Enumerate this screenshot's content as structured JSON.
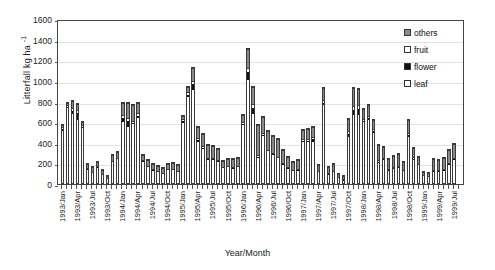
{
  "chart_data": {
    "type": "bar",
    "subtype": "stacked-bar",
    "title": "",
    "xlabel": "Year/Month",
    "ylabel": "Litterfall  kg ha -1",
    "ylabel_plain": "Litterfall kg ha-1",
    "ylim": [
      0,
      1600
    ],
    "yticks": [
      0,
      200,
      400,
      600,
      800,
      1000,
      1200,
      1400,
      1600
    ],
    "grid": true,
    "grid_axis": "y",
    "legend_position": "top-right",
    "legend": [
      "others",
      "fruit",
      "flower",
      "leaf"
    ],
    "colors": {
      "others": "#8a8a8a",
      "fruit": "#ffffff",
      "flower": "#111111",
      "leaf": "#ffffff",
      "outline": "#3a3a3a",
      "grid": "#e3e3e3",
      "axis": "#444444"
    },
    "x_tick_labels": [
      "1993/Jan",
      "1993/Apr",
      "1993/Jul",
      "1993/Oct",
      "1994/Jan",
      "1994/Apr",
      "1994/Jul",
      "1994/Oct",
      "1995/Jan",
      "1995/Apr",
      "1995/Jul",
      "1995/Oct",
      "1996/Jan",
      "1996/Apr",
      "1996/Jul",
      "1996/Oct",
      "1997/Jan",
      "1997/Apr",
      "1997/Jul",
      "1997/Oct",
      "1998/Jan",
      "1998/Apr",
      "1998/Jul",
      "1998/Oct",
      "1999/Jan",
      "1999/Apr",
      "1999/Jul"
    ],
    "x_tick_interval_months": 3,
    "categories": [
      "1993/Jan",
      "1993/Feb",
      "1993/Mar",
      "1993/Apr",
      "1993/May",
      "1993/Jun",
      "1993/Jul",
      "1993/Aug",
      "1993/Sep",
      "1993/Oct",
      "1993/Nov",
      "1993/Dec",
      "1994/Jan",
      "1994/Feb",
      "1994/Mar",
      "1994/Apr",
      "1994/May",
      "1994/Jun",
      "1994/Jul",
      "1994/Aug",
      "1994/Sep",
      "1994/Oct",
      "1994/Nov",
      "1994/Dec",
      "1995/Jan",
      "1995/Feb",
      "1995/Mar",
      "1995/Apr",
      "1995/May",
      "1995/Jun",
      "1995/Jul",
      "1995/Aug",
      "1995/Sep",
      "1995/Oct",
      "1995/Nov",
      "1995/Dec",
      "1996/Jan",
      "1996/Feb",
      "1996/Mar",
      "1996/Apr",
      "1996/May",
      "1996/Jun",
      "1996/Jul",
      "1996/Aug",
      "1996/Sep",
      "1996/Oct",
      "1996/Nov",
      "1996/Dec",
      "1997/Jan",
      "1997/Feb",
      "1997/Mar",
      "1997/Apr",
      "1997/May",
      "1997/Jun",
      "1997/Jul",
      "1997/Aug",
      "1997/Sep",
      "1997/Oct",
      "1997/Nov",
      "1997/Dec",
      "1998/Jan",
      "1998/Feb",
      "1998/Mar",
      "1998/Apr",
      "1998/May",
      "1998/Jun",
      "1998/Jul",
      "1998/Aug",
      "1998/Sep",
      "1998/Oct",
      "1998/Nov",
      "1998/Dec",
      "1999/Jan",
      "1999/Feb",
      "1999/Mar",
      "1999/Apr",
      "1999/May",
      "1999/Jun",
      "1999/Jul",
      "1999/Aug"
    ],
    "series": [
      {
        "name": "leaf",
        "values": [
          540,
          760,
          700,
          640,
          570,
          160,
          120,
          180,
          100,
          60,
          230,
          250,
          620,
          570,
          600,
          660,
          240,
          180,
          150,
          130,
          110,
          145,
          150,
          120,
          620,
          870,
          930,
          430,
          360,
          250,
          250,
          230,
          160,
          170,
          165,
          170,
          600,
          1030,
          700,
          260,
          480,
          330,
          300,
          260,
          200,
          160,
          130,
          140,
          430,
          430,
          430,
          120,
          790,
          105,
          120,
          60,
          40,
          480,
          690,
          690,
          620,
          640,
          520,
          220,
          250,
          140,
          160,
          170,
          130,
          480,
          250,
          190,
          85,
          70,
          130,
          130,
          140,
          200,
          250,
          0
        ]
      },
      {
        "name": "flower",
        "values": [
          20,
          10,
          30,
          70,
          10,
          5,
          5,
          5,
          5,
          5,
          5,
          5,
          40,
          60,
          10,
          25,
          5,
          5,
          5,
          5,
          5,
          5,
          5,
          5,
          15,
          20,
          60,
          15,
          10,
          5,
          5,
          5,
          5,
          5,
          5,
          5,
          10,
          80,
          60,
          10,
          10,
          5,
          5,
          5,
          5,
          5,
          5,
          5,
          10,
          10,
          25,
          5,
          20,
          5,
          5,
          5,
          5,
          30,
          50,
          60,
          15,
          20,
          15,
          10,
          5,
          5,
          5,
          5,
          5,
          15,
          10,
          5,
          5,
          5,
          5,
          5,
          5,
          5,
          5,
          0
        ]
      },
      {
        "name": "fruit",
        "values": [
          10,
          10,
          20,
          20,
          10,
          5,
          5,
          5,
          5,
          5,
          5,
          5,
          20,
          20,
          15,
          20,
          5,
          5,
          5,
          5,
          5,
          5,
          5,
          5,
          10,
          15,
          20,
          15,
          10,
          5,
          5,
          5,
          5,
          5,
          5,
          5,
          10,
          30,
          25,
          10,
          10,
          5,
          5,
          5,
          5,
          5,
          5,
          5,
          10,
          10,
          15,
          5,
          15,
          5,
          5,
          5,
          5,
          20,
          30,
          25,
          10,
          15,
          10,
          10,
          5,
          5,
          5,
          5,
          5,
          10,
          10,
          5,
          5,
          5,
          5,
          5,
          5,
          5,
          5,
          0
        ]
      },
      {
        "name": "others",
        "values": [
          10,
          20,
          60,
          60,
          20,
          30,
          40,
          30,
          40,
          20,
          50,
          60,
          120,
          150,
          150,
          95,
          40,
          50,
          40,
          40,
          45,
          45,
          50,
          60,
          25,
          45,
          120,
          100,
          110,
          130,
          120,
          110,
          60,
          70,
          75,
          80,
          60,
          180,
          170,
          300,
          160,
          180,
          170,
          180,
          130,
          100,
          80,
          90,
          80,
          90,
          90,
          60,
          115,
          60,
          70,
          40,
          40,
          110,
          170,
          160,
          90,
          100,
          90,
          150,
          110,
          100,
          110,
          120,
          80,
          130,
          90,
          70,
          30,
          40,
          110,
          100,
          110,
          130,
          140,
          0
        ]
      }
    ]
  }
}
